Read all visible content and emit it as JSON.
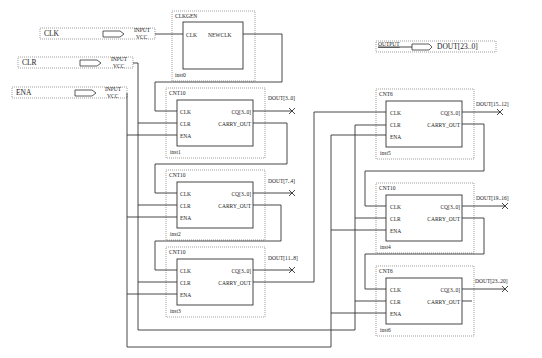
{
  "inputs": [
    {
      "name": "CLK",
      "type": "INPUT",
      "default": "VCC"
    },
    {
      "name": "CLR",
      "type": "INPUT",
      "default": "VCC"
    },
    {
      "name": "ENA",
      "type": "INPUT",
      "default": "VCC"
    }
  ],
  "output": {
    "type": "OUTPUT",
    "name": "DOUT[23..0]"
  },
  "clkgen": {
    "type": "CLKGEN",
    "inst": "inst0",
    "in_port": "CLK",
    "out_port": "NEWCLK"
  },
  "counters": [
    {
      "type": "CNT10",
      "inst": "inst1",
      "out_label": "DOUT[3..0]"
    },
    {
      "type": "CNT10",
      "inst": "inst2",
      "out_label": "DOUT[7..4]"
    },
    {
      "type": "CNT10",
      "inst": "inst3",
      "out_label": "DOUT[11..8]"
    },
    {
      "type": "CNT6",
      "inst": "inst5",
      "out_label": "DOUT[15..12]"
    },
    {
      "type": "CNT10",
      "inst": "inst4",
      "out_label": "DOUT[19..16]"
    },
    {
      "type": "CNT6",
      "inst": "inst6",
      "out_label": "DOUT[23..20]"
    }
  ],
  "ports": {
    "clk": "CLK",
    "clr": "CLR",
    "ena": "ENA",
    "cq": "CQ[3..0]",
    "carry": "CARRY_OUT"
  }
}
